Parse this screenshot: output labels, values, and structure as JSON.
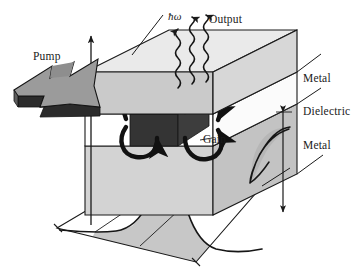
{
  "figure": {
    "kind": "schematic-diagram",
    "background_color": "#ffffff"
  },
  "labels": {
    "pump": "Pump",
    "photon_energy": "ħω",
    "output": "Output",
    "metal_top": "Metal",
    "dielectric": "Dielectric",
    "metal_bottom": "Metal",
    "gain": "Gain"
  },
  "icons": {
    "pump_arrow": "thick-block-arrow-icon",
    "photon_wave": "wavy-photon-arrow-icon",
    "field_loop": "curved-field-loop-arrow-icon",
    "axis_arrow": "vertical-axis-arrow-icon",
    "dimension_arrow": "double-headed-dimension-arrow-icon",
    "mode_profile_vertical": "vertical-mode-profile-curve-icon",
    "mode_profile_lateral": "gaussian-lateral-mode-profile-icon"
  },
  "colors": {
    "top_slab_top_face": "#e9e9e9",
    "top_slab_front_face": "#c9c9c9",
    "top_slab_side_face": "#d6d6d6",
    "dielectric_face": "#ffffff",
    "bottom_slab_front_face": "#d2d2d2",
    "bottom_slab_side_face": "#c2c2c2",
    "bottom_slab_top_face": "#e4e4e4",
    "gain_block": "#3a3a3a",
    "gain_block_side": "#545454",
    "pump_arrow_top": "#9a9a9a",
    "pump_arrow_side": "#6e6e6e",
    "pump_arrow_front": "#2e2e2e",
    "mode_fill": "#b9b9b9",
    "outline": "#1a1a1a",
    "text": "#1a1a1a"
  },
  "geometry": {
    "projection": "oblique-cabinet",
    "photon_arrow_count": 3,
    "field_loop_count": 4,
    "layer_stack": [
      "Metal",
      "Dielectric",
      "Metal"
    ]
  }
}
